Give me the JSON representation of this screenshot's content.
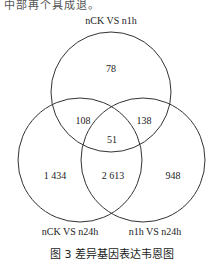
{
  "header_fragment": "中部再个具成退。",
  "sets": [
    {
      "label": "nCK VS n1h",
      "cx": 111,
      "cy": 92,
      "r": 60
    },
    {
      "label": "nCK VS n24h",
      "cx": 80,
      "cy": 160,
      "r": 62
    },
    {
      "label": "n1h VS n24h",
      "cx": 143,
      "cy": 160,
      "r": 62
    }
  ],
  "regions": {
    "only_nCK_n1h": "78",
    "nCK_n1h_and_nCK_n24h": "108",
    "nCK_n1h_and_n1h_n24h": "138",
    "all_three": "51",
    "only_nCK_n24h": "1 434",
    "nCK_n24h_and_n1h_n24h": "2 613",
    "only_n1h_n24h": "948"
  },
  "caption": "图 3   差异基因表达韦恩图",
  "colors": {
    "stroke": "#333333",
    "text": "#222222"
  }
}
